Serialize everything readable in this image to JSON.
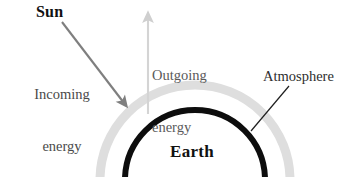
{
  "figure": {
    "type": "diagram",
    "background_color": "#ffffff"
  },
  "labels": {
    "sun": "Sun",
    "incoming_line1": "Incoming",
    "incoming_line2": "energy",
    "outgoing_line1": "Outgoing",
    "outgoing_line2": "energy",
    "atmosphere": "Atmosphere",
    "earth": "Earth"
  },
  "colors": {
    "earth_arc": "#0d0d0d",
    "atmosphere_arc": "#dcdcdc",
    "incoming_arrow": "#7f7f7f",
    "outgoing_arrow": "#d2d2d2",
    "leader_line": "#1f1f1f",
    "text_dark": "#111111",
    "text_grey": "#4a4a4a"
  },
  "elements": {
    "earth_arc": {
      "name": "earth-surface-arc",
      "center_x": 195,
      "center_y": 180,
      "radius": 70,
      "stroke_width": 6
    },
    "atmosphere_arc": {
      "name": "atmosphere-arc",
      "center_x": 195,
      "center_y": 180,
      "radius": 95,
      "stroke_width": 9
    },
    "incoming_arrow": {
      "name": "incoming-energy-arrow",
      "x1": 62,
      "y1": 22,
      "x2": 128,
      "y2": 108,
      "direction": "down-right"
    },
    "outgoing_arrow": {
      "name": "outgoing-energy-arrow",
      "x1": 148,
      "y1": 114,
      "x2": 148,
      "y2": 12,
      "direction": "up"
    },
    "atmosphere_leader": {
      "name": "atmosphere-leader-line",
      "x1": 289,
      "y1": 86,
      "x2": 251,
      "y2": 131
    }
  }
}
